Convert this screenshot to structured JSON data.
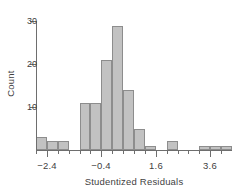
{
  "figure": {
    "top_partial_text": "",
    "background_color": "#ffffff",
    "bar_fill_color": "#c2c2c2",
    "bar_border_color": "#8d8d8d",
    "axis_color": "#6e6e6e",
    "text_color": "#3f3f3f"
  },
  "axes": {
    "x_title": "Studentized Residuals",
    "y_title": "Count",
    "x_ticks": [
      {
        "label": "−2.4",
        "value": -2.4
      },
      {
        "label": "−0.4",
        "value": -0.4
      },
      {
        "label": "1.6",
        "value": 1.6
      },
      {
        "label": "3.6",
        "value": 3.6
      }
    ],
    "y_ticks": [
      {
        "label": "10",
        "value": 10
      },
      {
        "label": "20",
        "value": 20
      },
      {
        "label": "30",
        "value": 30
      }
    ],
    "x_range": [
      -2.8,
      4.4
    ],
    "y_range": [
      0,
      31
    ],
    "grid": false
  },
  "chart_data": {
    "type": "bar",
    "title": "",
    "subtitle": "",
    "xlabel": "Studentized Residuals",
    "ylabel": "Count",
    "xlim": [
      -2.8,
      4.4
    ],
    "ylim": [
      0,
      31
    ],
    "grid": false,
    "legend": null,
    "bin_width": 0.4,
    "bin_starts": [
      -2.8,
      -2.4,
      -2.0,
      -1.6,
      -1.2,
      -0.8,
      -0.4,
      0.0,
      0.4,
      0.8,
      1.2,
      1.6,
      2.0,
      2.4,
      2.8,
      3.2,
      3.6,
      4.0
    ],
    "categories": [
      "-2.8 to -2.4",
      "-2.4 to -2.0",
      "-2.0 to -1.6",
      "-1.6 to -1.2",
      "-1.2 to -0.8",
      "-0.8 to -0.4",
      "-0.4 to 0.0",
      "0.0 to 0.4",
      "0.4 to 0.8",
      "0.8 to 1.2",
      "1.2 to 1.6",
      "1.6 to 2.0",
      "2.0 to 2.4",
      "2.4 to 2.8",
      "2.8 to 3.2",
      "3.2 to 3.6",
      "3.6 to 4.0",
      "4.0 to 4.4"
    ],
    "values": [
      3,
      2,
      2,
      0,
      11,
      11,
      21,
      29,
      14,
      5,
      1,
      0,
      2,
      0,
      0,
      1,
      1,
      1
    ]
  }
}
